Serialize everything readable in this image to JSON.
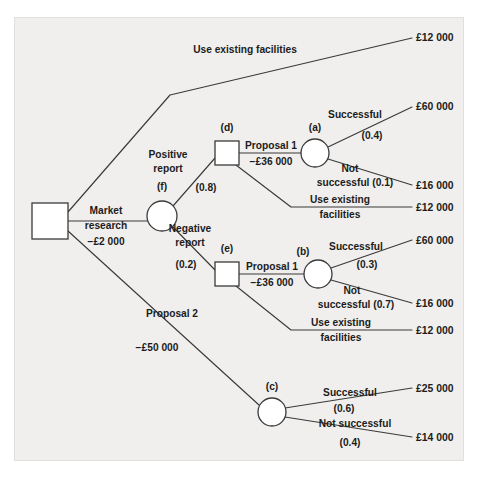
{
  "figure": {
    "type": "decision-tree",
    "currency_symbol": "£",
    "caption": ""
  },
  "nodes": [
    {
      "id": "root",
      "shape": "square",
      "label": "",
      "x": 50,
      "y": 221,
      "size": 36
    },
    {
      "id": "f",
      "shape": "circle",
      "label": "(f)",
      "x": 162,
      "y": 216,
      "size": 30,
      "label_x": 162,
      "label_y": 190
    },
    {
      "id": "d",
      "shape": "square",
      "label": "(d)",
      "x": 227,
      "y": 153,
      "size": 24,
      "label_x": 227,
      "label_y": 131
    },
    {
      "id": "e",
      "shape": "square",
      "label": "(e)",
      "x": 227,
      "y": 274,
      "size": 24,
      "label_x": 227,
      "label_y": 252
    },
    {
      "id": "a",
      "shape": "circle",
      "label": "(a)",
      "x": 315,
      "y": 153,
      "size": 28,
      "label_x": 315,
      "label_y": 131
    },
    {
      "id": "b",
      "shape": "circle",
      "label": "(b)",
      "x": 318,
      "y": 274,
      "size": 28,
      "label_x": 303,
      "label_y": 255
    },
    {
      "id": "c",
      "shape": "circle",
      "label": "(c)",
      "x": 272,
      "y": 412,
      "size": 28,
      "label_x": 272,
      "label_y": 390
    }
  ],
  "edges": [
    {
      "name": "root-to-use-existing-facilities",
      "points": "68,212 170,95 412,38"
    },
    {
      "name": "root-to-market-research",
      "points": "68,221 147,221"
    },
    {
      "name": "root-to-proposal-2",
      "points": "68,231 259,405"
    },
    {
      "name": "f-to-positive-report",
      "points": "173,206 215,158"
    },
    {
      "name": "f-to-negative-report",
      "points": "173,227 215,270"
    },
    {
      "name": "d-to-proposal-1",
      "points": "239,153 302,153"
    },
    {
      "name": "d-to-use-existing-facilities",
      "points": "236,165 291,207 412,207"
    },
    {
      "name": "a-to-successful",
      "points": "328,147 412,107"
    },
    {
      "name": "a-to-not-successful",
      "points": "328,159 412,185"
    },
    {
      "name": "e-to-proposal-1",
      "points": "239,274 305,274"
    },
    {
      "name": "e-to-use-existing-facilities",
      "points": "236,286 291,330 412,330"
    },
    {
      "name": "b-to-successful",
      "points": "331,268 412,240"
    },
    {
      "name": "b-to-not-successful",
      "points": "331,280 412,303"
    },
    {
      "name": "c-to-successful",
      "points": "285,408 412,388"
    },
    {
      "name": "c-to-not-successful",
      "points": "285,417 412,437"
    }
  ],
  "labels": [
    {
      "name": "label-use-existing-facilities-top",
      "text": "Use existing facilities",
      "x": 245,
      "y": 53,
      "anchor": "middle",
      "kind": "branch"
    },
    {
      "name": "label-market-research",
      "text": "Market",
      "x": 106,
      "y": 214,
      "anchor": "middle",
      "kind": "branch"
    },
    {
      "name": "label-market-research-2",
      "text": "research",
      "x": 106,
      "y": 229,
      "anchor": "middle",
      "kind": "branch"
    },
    {
      "name": "label-market-research-cost",
      "text": "−£2 000",
      "x": 106,
      "y": 245,
      "anchor": "middle",
      "kind": "cost"
    },
    {
      "name": "label-positive-report",
      "text": "Positive",
      "x": 168,
      "y": 158,
      "anchor": "middle",
      "kind": "branch"
    },
    {
      "name": "label-positive-report-2",
      "text": "report",
      "x": 168,
      "y": 172,
      "anchor": "middle",
      "kind": "branch"
    },
    {
      "name": "label-positive-report-prob",
      "text": "(0.8)",
      "x": 206,
      "y": 191,
      "anchor": "middle",
      "kind": "prob"
    },
    {
      "name": "label-negative-report",
      "text": "Negative",
      "x": 190,
      "y": 232,
      "anchor": "middle",
      "kind": "branch"
    },
    {
      "name": "label-negative-report-2",
      "text": "report",
      "x": 190,
      "y": 246,
      "anchor": "middle",
      "kind": "branch"
    },
    {
      "name": "label-negative-report-prob",
      "text": "(0.2)",
      "x": 186,
      "y": 268,
      "anchor": "middle",
      "kind": "prob"
    },
    {
      "name": "label-proposal-1-d",
      "text": "Proposal 1",
      "x": 271,
      "y": 149,
      "anchor": "middle",
      "kind": "branch"
    },
    {
      "name": "label-proposal-1-d-cost",
      "text": "−£36 000",
      "x": 271,
      "y": 165,
      "anchor": "middle",
      "kind": "cost"
    },
    {
      "name": "label-successful-a",
      "text": "Successful",
      "x": 355,
      "y": 118,
      "anchor": "middle",
      "kind": "branch"
    },
    {
      "name": "label-successful-a-prob",
      "text": "(0.4)",
      "x": 372,
      "y": 139,
      "anchor": "middle",
      "kind": "prob"
    },
    {
      "name": "label-not-successful-a",
      "text": "Not",
      "x": 350,
      "y": 172,
      "anchor": "middle",
      "kind": "branch"
    },
    {
      "name": "label-not-successful-a-2",
      "text": "successful (0.1)",
      "x": 355,
      "y": 186,
      "anchor": "middle",
      "kind": "branch"
    },
    {
      "name": "label-use-existing-d",
      "text": "Use existing",
      "x": 340,
      "y": 203,
      "anchor": "middle",
      "kind": "branch"
    },
    {
      "name": "label-use-existing-d-2",
      "text": "facilities",
      "x": 340,
      "y": 218,
      "anchor": "middle",
      "kind": "branch"
    },
    {
      "name": "label-proposal-1-e",
      "text": "Proposal 1",
      "x": 272,
      "y": 270,
      "anchor": "middle",
      "kind": "branch"
    },
    {
      "name": "label-proposal-1-e-cost",
      "text": "−£36 000",
      "x": 272,
      "y": 286,
      "anchor": "middle",
      "kind": "cost"
    },
    {
      "name": "label-successful-b",
      "text": "Successful",
      "x": 356,
      "y": 250,
      "anchor": "middle",
      "kind": "branch"
    },
    {
      "name": "label-successful-b-prob",
      "text": "(0.3)",
      "x": 367,
      "y": 268,
      "anchor": "middle",
      "kind": "prob"
    },
    {
      "name": "label-not-successful-b",
      "text": "Not",
      "x": 352,
      "y": 294,
      "anchor": "middle",
      "kind": "branch"
    },
    {
      "name": "label-not-successful-b-2",
      "text": "successful (0.7)",
      "x": 356,
      "y": 308,
      "anchor": "middle",
      "kind": "branch"
    },
    {
      "name": "label-use-existing-e",
      "text": "Use existing",
      "x": 341,
      "y": 326,
      "anchor": "middle",
      "kind": "branch"
    },
    {
      "name": "label-use-existing-e-2",
      "text": "facilities",
      "x": 341,
      "y": 341,
      "anchor": "middle",
      "kind": "branch"
    },
    {
      "name": "label-proposal-2",
      "text": "Proposal 2",
      "x": 172,
      "y": 317,
      "anchor": "middle",
      "kind": "branch"
    },
    {
      "name": "label-proposal-2-cost",
      "text": "−£50 000",
      "x": 157,
      "y": 351,
      "anchor": "middle",
      "kind": "cost"
    },
    {
      "name": "label-successful-c",
      "text": "Successful",
      "x": 350,
      "y": 396,
      "anchor": "middle",
      "kind": "branch"
    },
    {
      "name": "label-successful-c-prob",
      "text": "(0.6)",
      "x": 344,
      "y": 412,
      "anchor": "middle",
      "kind": "prob"
    },
    {
      "name": "label-not-successful-c",
      "text": "Not successful",
      "x": 355,
      "y": 427,
      "anchor": "middle",
      "kind": "branch"
    },
    {
      "name": "label-not-successful-c-prob",
      "text": "(0.4)",
      "x": 350,
      "y": 446,
      "anchor": "middle",
      "kind": "prob"
    }
  ],
  "payoffs": [
    {
      "name": "payoff-use-existing-top",
      "text": "£12 000",
      "x": 416,
      "y": 41
    },
    {
      "name": "payoff-successful-a",
      "text": "£60 000",
      "x": 416,
      "y": 110
    },
    {
      "name": "payoff-not-successful-a",
      "text": "£16 000",
      "x": 416,
      "y": 189
    },
    {
      "name": "payoff-use-existing-d",
      "text": "£12 000",
      "x": 416,
      "y": 211
    },
    {
      "name": "payoff-successful-b",
      "text": "£60 000",
      "x": 416,
      "y": 244
    },
    {
      "name": "payoff-not-successful-b",
      "text": "£16 000",
      "x": 416,
      "y": 307
    },
    {
      "name": "payoff-use-existing-e",
      "text": "£12 000",
      "x": 416,
      "y": 334
    },
    {
      "name": "payoff-successful-c",
      "text": "£25 000",
      "x": 416,
      "y": 392
    },
    {
      "name": "payoff-not-successful-c",
      "text": "£14 000",
      "x": 416,
      "y": 441
    }
  ],
  "chart_data": {
    "type": "diagram",
    "title": "",
    "decision_nodes": [
      "root",
      "(d)",
      "(e)"
    ],
    "chance_nodes": [
      "(f)",
      "(a)",
      "(b)",
      "(c)"
    ],
    "branches": [
      {
        "from": "root",
        "label": "Use existing facilities",
        "cost": null,
        "probability": null,
        "payoff": "£12 000"
      },
      {
        "from": "root",
        "label": "Market research",
        "cost": "−£2 000",
        "probability": null,
        "to": "(f)"
      },
      {
        "from": "root",
        "label": "Proposal 2",
        "cost": "−£50 000",
        "probability": null,
        "to": "(c)"
      },
      {
        "from": "(f)",
        "label": "Positive report",
        "probability": 0.8,
        "to": "(d)"
      },
      {
        "from": "(f)",
        "label": "Negative report",
        "probability": 0.2,
        "to": "(e)"
      },
      {
        "from": "(d)",
        "label": "Proposal 1",
        "cost": "−£36 000",
        "to": "(a)"
      },
      {
        "from": "(d)",
        "label": "Use existing facilities",
        "payoff": "£12 000"
      },
      {
        "from": "(a)",
        "label": "Successful",
        "probability": 0.4,
        "payoff": "£60 000"
      },
      {
        "from": "(a)",
        "label": "Not successful",
        "probability": 0.1,
        "payoff": "£16 000"
      },
      {
        "from": "(e)",
        "label": "Proposal 1",
        "cost": "−£36 000",
        "to": "(b)"
      },
      {
        "from": "(e)",
        "label": "Use existing facilities",
        "payoff": "£12 000"
      },
      {
        "from": "(b)",
        "label": "Successful",
        "probability": 0.3,
        "payoff": "£60 000"
      },
      {
        "from": "(b)",
        "label": "Not successful",
        "probability": 0.7,
        "payoff": "£16 000"
      },
      {
        "from": "(c)",
        "label": "Successful",
        "probability": 0.6,
        "payoff": "£25 000"
      },
      {
        "from": "(c)",
        "label": "Not successful",
        "probability": 0.4,
        "payoff": "£14 000"
      }
    ]
  }
}
